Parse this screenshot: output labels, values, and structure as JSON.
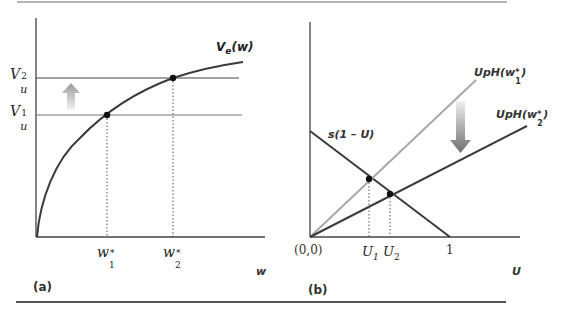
{
  "figure": {
    "panels": [
      {
        "id": "a",
        "label": "(a)",
        "x_axis_label": "w",
        "curve_label": "V",
        "curve_label_sub": "e",
        "curve_label_arg": "(w)",
        "levels": [
          {
            "name": "V",
            "sub": "u",
            "sup": "2"
          },
          {
            "name": "V",
            "sub": "u",
            "sup": "1"
          }
        ],
        "x_ticks": [
          {
            "name": "w",
            "sub": "1",
            "sup": "*"
          },
          {
            "name": "w",
            "sub": "2",
            "sup": "*"
          }
        ],
        "arrow_direction": "up"
      },
      {
        "id": "b",
        "label": "(b)",
        "x_axis_label": "U",
        "origin_label": "(0,0)",
        "end_tick": "1",
        "line_labels": {
          "separation": "s(1 – U)",
          "inflow_1": "UpH(w",
          "inflow_1_sub": "1",
          "inflow_1_sup": "*",
          "inflow_2": "UpH(w",
          "inflow_2_sub": "2",
          "inflow_2_sup": "*",
          "close": ")"
        },
        "x_ticks": [
          {
            "name": "U",
            "sub": "1"
          },
          {
            "name": "U",
            "sub": "2"
          }
        ],
        "arrow_direction": "down"
      }
    ],
    "colors": {
      "axis": "#444444",
      "curve": "#3a3a3a",
      "gray_line": "#a8a8a8",
      "dark_line": "#3a3a3a",
      "point": "#111111"
    }
  }
}
